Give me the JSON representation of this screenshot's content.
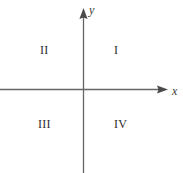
{
  "figure": {
    "type": "coordinate-plane-diagram",
    "width": 183,
    "height": 173,
    "background_color": "#ffffff",
    "line_color": "#666666",
    "text_color": "#2e2e2e"
  },
  "axes": {
    "origin": {
      "x": 83,
      "y": 89
    },
    "x_axis": {
      "label": "x",
      "label_style": "italic",
      "start_x": 0,
      "end_x": 168,
      "y": 89,
      "arrow": "right"
    },
    "y_axis": {
      "label": "y",
      "label_style": "italic",
      "start_y": 173,
      "end_y": 8,
      "x": 83,
      "arrow": "up"
    }
  },
  "quadrants": [
    {
      "id": "I",
      "label": "I",
      "position": "upper-right"
    },
    {
      "id": "II",
      "label": "II",
      "position": "upper-left"
    },
    {
      "id": "III",
      "label": "III",
      "position": "lower-left"
    },
    {
      "id": "IV",
      "label": "IV",
      "position": "lower-right"
    }
  ]
}
